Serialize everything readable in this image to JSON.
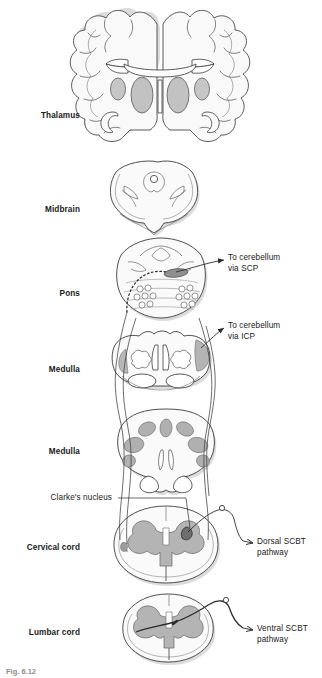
{
  "figure": {
    "caption": "Fig. 6.12",
    "colors": {
      "outline": "#3c3c3c",
      "gray_matter": "#bcbcbc",
      "gray_matter_dark": "#9a9a9a",
      "white_matter": "#f7f7f7",
      "shadow": "#d8d8d8",
      "tract_line": "#2b2b2b",
      "text": "#1a1a1a"
    }
  },
  "left_labels": [
    {
      "id": "thalamus",
      "text": "Thalamus",
      "x": 0,
      "y": 111
    },
    {
      "id": "midbrain",
      "text": "Midbrain",
      "x": 0,
      "y": 205
    },
    {
      "id": "pons",
      "text": "Pons",
      "x": 0,
      "y": 289
    },
    {
      "id": "medulla-upper",
      "text": "Medulla",
      "x": 0,
      "y": 365
    },
    {
      "id": "medulla-lower",
      "text": "Medulla",
      "x": 0,
      "y": 447
    },
    {
      "id": "cervical-cord",
      "text": "Cervical cord",
      "x": 0,
      "y": 543
    },
    {
      "id": "lumbar-cord",
      "text": "Lumbar cord",
      "x": 0,
      "y": 628
    }
  ],
  "leader_labels": [
    {
      "id": "clarkes-nucleus",
      "text": "Clarke's nucleus",
      "x": 0,
      "y": 496
    }
  ],
  "right_labels": [
    {
      "id": "to-cerebellum-scp",
      "text": "To cerebellum\nvia SCP",
      "x": 228,
      "y": 258
    },
    {
      "id": "to-cerebellum-icp",
      "text": "To cerebellum\nvia ICP",
      "x": 228,
      "y": 325
    },
    {
      "id": "dorsal-scbt",
      "text": "Dorsal SCBT\npathway",
      "x": 257,
      "y": 538
    },
    {
      "id": "ventral-scbt",
      "text": "Ventral SCBT\npathway",
      "x": 257,
      "y": 624
    }
  ],
  "sections": [
    {
      "id": "cerebrum",
      "name": "Coronal cerebral hemispheres at thalamus"
    },
    {
      "id": "midbrain",
      "name": "Midbrain cross-section"
    },
    {
      "id": "pons",
      "name": "Pons cross-section"
    },
    {
      "id": "medulla-upper",
      "name": "Upper medulla cross-section"
    },
    {
      "id": "medulla-lower",
      "name": "Lower medulla cross-section"
    },
    {
      "id": "cervical-cord",
      "name": "Cervical spinal cord cross-section"
    },
    {
      "id": "lumbar-cord",
      "name": "Lumbar spinal cord cross-section"
    }
  ]
}
